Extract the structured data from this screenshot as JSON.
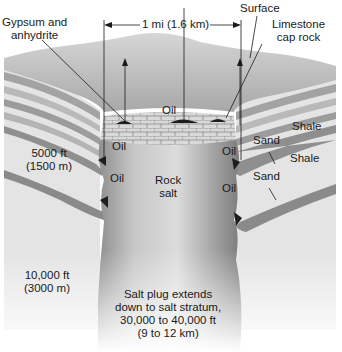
{
  "diagram": {
    "colors": {
      "background": "#ffffff",
      "surface": "#c9c9c9",
      "layer_light": "#d8d8d8",
      "layer_mid": "#a9a9a9",
      "layer_dark": "#8a8a8a",
      "salt": "#bdbdbd",
      "salt_shadow": "#8f8f8f",
      "oil": "#1e1e1e",
      "text": "#1a1a1a"
    },
    "labels": {
      "gypsum": [
        "Gypsum and",
        "anhydrite"
      ],
      "width_marker": "1 mi (1.6 km)",
      "surface": "Surface",
      "limestone": [
        "Limestone",
        "cap rock"
      ],
      "oil_cap": "Oil",
      "oil_left_upper": "Oil",
      "oil_left_lower": "Oil",
      "oil_right_upper": "Oil",
      "oil_right_lower": "Oil",
      "shale_upper": "Shale",
      "sand_upper": "Sand",
      "shale_lower": "Shale",
      "sand_lower": "Sand",
      "depth_5000": [
        "5000 ft",
        "(1500 m)"
      ],
      "depth_10000": [
        "10,000 ft",
        "(3000 m)"
      ],
      "rock_salt": [
        "Rock",
        "salt"
      ],
      "salt_plug": [
        "Salt plug extends",
        "down to salt stratum,",
        "30,000 to 40,000 ft",
        "(9 to 12 km)"
      ]
    }
  }
}
